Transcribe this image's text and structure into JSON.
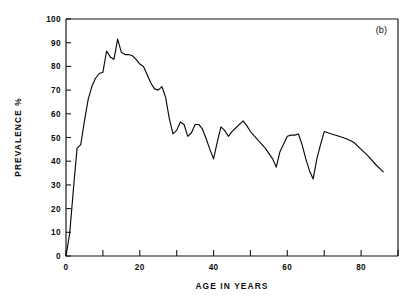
{
  "figure": {
    "panel_label": "(b)",
    "background_color": "#ffffff",
    "line_color": "#0a0a0a",
    "axis_color": "#111111"
  },
  "chart_data": {
    "type": "line",
    "title": "",
    "subtitle": "",
    "xlabel": "AGE IN YEARS",
    "ylabel": "PREVALENCE %",
    "xlim": [
      0,
      90
    ],
    "ylim": [
      0,
      100
    ],
    "xticks": [
      0,
      20,
      40,
      60,
      80
    ],
    "xticklabels": [
      "0",
      "20",
      "40",
      "60",
      "80"
    ],
    "xminorticks": [
      10,
      30,
      50,
      70,
      90
    ],
    "yticks": [
      0,
      10,
      20,
      30,
      40,
      50,
      60,
      70,
      80,
      90,
      100
    ],
    "yticklabels": [
      "0",
      "10",
      "20",
      "30",
      "40",
      "50",
      "60",
      "70",
      "80",
      "90",
      "100"
    ],
    "grid": false,
    "legend": false,
    "legend_position": "none",
    "annotations": [
      "(b)"
    ],
    "series": [
      {
        "name": "prevalence",
        "x": [
          0,
          1,
          2,
          3,
          4,
          5,
          6,
          7,
          8,
          9,
          10,
          11,
          12,
          13,
          14,
          15,
          16,
          17,
          18,
          19,
          20,
          21,
          22,
          23,
          24,
          25,
          26,
          27,
          28,
          29,
          30,
          31,
          32,
          33,
          34,
          35,
          36,
          37,
          38,
          39,
          40,
          41,
          42,
          43,
          44,
          45,
          46,
          47,
          48,
          49,
          50,
          52,
          54,
          56,
          57,
          58,
          60,
          61,
          62,
          63,
          64,
          65,
          66,
          67,
          68,
          69,
          70,
          72,
          74,
          76,
          78,
          80,
          82,
          84,
          86
        ],
        "y": [
          0,
          9.5,
          28.0,
          45.5,
          47.0,
          57.0,
          66.0,
          71.5,
          75.0,
          77.0,
          77.5,
          86.5,
          84.0,
          83.0,
          91.5,
          86.0,
          85.0,
          85.0,
          84.5,
          83.0,
          81.0,
          80.0,
          76.5,
          73.0,
          70.5,
          70.0,
          71.5,
          67.0,
          58.0,
          51.5,
          53.0,
          56.5,
          55.5,
          50.5,
          52.0,
          55.5,
          55.5,
          53.5,
          49.5,
          45.0,
          41.0,
          48.0,
          54.5,
          53.0,
          50.5,
          52.5,
          54.0,
          55.5,
          57.0,
          55.0,
          52.5,
          49.0,
          45.5,
          41.0,
          37.5,
          44.0,
          50.5,
          51.0,
          51.0,
          51.5,
          47.0,
          41.0,
          36.0,
          32.5,
          41.0,
          47.0,
          52.5,
          51.5,
          50.5,
          49.5,
          48.0,
          45.0,
          42.0,
          38.5,
          35.5
        ],
        "color": "#0a0a0a"
      }
    ],
    "peak": {
      "x": 14,
      "y": 91.5
    },
    "minimum_after_peak": {
      "x": 67,
      "y": 32.5
    },
    "endpoint": {
      "x": 86,
      "y": 35.5
    }
  }
}
